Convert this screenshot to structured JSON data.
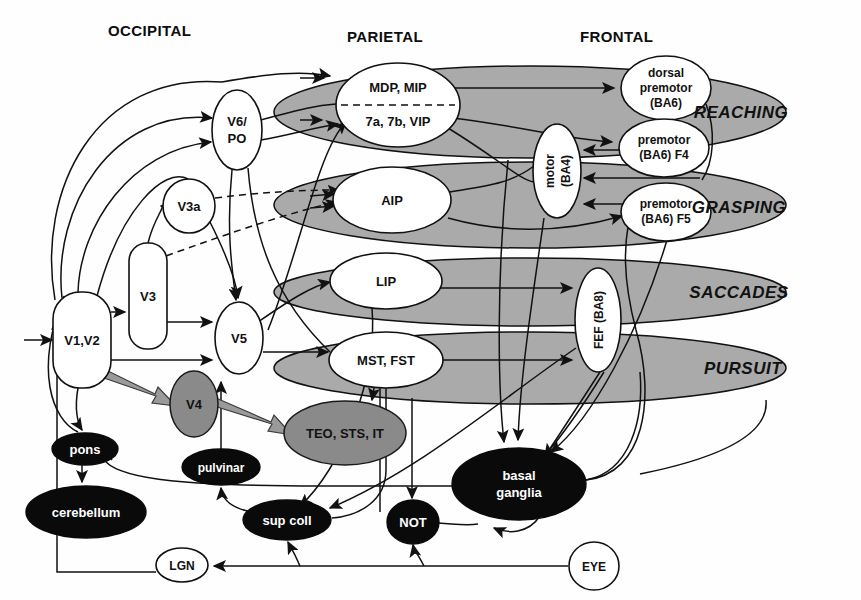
{
  "figure": {
    "lobe_headers": [
      {
        "id": "occipital",
        "label": "OCCIPITAL",
        "x": 108,
        "y": 36
      },
      {
        "id": "parietal",
        "label": "PARIETAL",
        "x": 347,
        "y": 42
      },
      {
        "id": "frontal",
        "label": "FRONTAL",
        "x": 580,
        "y": 42
      }
    ],
    "function_bands": [
      {
        "id": "reaching",
        "label": "REACHING",
        "lx": 741,
        "ly": 118,
        "cx": 530,
        "cy": 112,
        "rx": 256,
        "ry": 46
      },
      {
        "id": "grasping",
        "label": "GRASPING",
        "lx": 739,
        "ly": 213,
        "cx": 530,
        "cy": 205,
        "rx": 256,
        "ry": 43
      },
      {
        "id": "saccades",
        "label": "SACCADES",
        "lx": 739,
        "ly": 298,
        "cx": 530,
        "cy": 292,
        "rx": 256,
        "ry": 34
      },
      {
        "id": "pursuit",
        "label": "PURSUIT",
        "lx": 743,
        "ly": 374,
        "cx": 530,
        "cy": 368,
        "rx": 256,
        "ry": 36
      }
    ],
    "nodes": [
      {
        "id": "v1v2",
        "label": "V1,V2",
        "shape": "rounded",
        "fill": "white",
        "cx": 82,
        "cy": 340,
        "rx": 29,
        "ry": 48
      },
      {
        "id": "v3",
        "label": "V3",
        "shape": "rounded",
        "fill": "white",
        "cx": 148,
        "cy": 296,
        "rx": 19,
        "ry": 53
      },
      {
        "id": "v3a",
        "label": "V3a",
        "shape": "ellipse",
        "fill": "white",
        "cx": 189,
        "cy": 206,
        "rx": 26,
        "ry": 27
      },
      {
        "id": "v6po",
        "label": "V6/\nPO",
        "shape": "ellipse",
        "fill": "white",
        "cx": 237,
        "cy": 130,
        "rx": 25,
        "ry": 40
      },
      {
        "id": "v5",
        "label": "V5",
        "shape": "ellipse",
        "fill": "white",
        "cx": 239,
        "cy": 338,
        "rx": 24,
        "ry": 36
      },
      {
        "id": "v4",
        "label": "V4",
        "shape": "ellipse",
        "fill": "gray",
        "cx": 194,
        "cy": 404,
        "rx": 24,
        "ry": 33
      },
      {
        "id": "teostsit",
        "label": "TEO, STS, IT",
        "shape": "ellipse",
        "fill": "gray",
        "cx": 345,
        "cy": 433,
        "rx": 61,
        "ry": 32
      },
      {
        "id": "mdp_7a",
        "label": "MDP, MIP|7a, 7b, VIP",
        "shape": "ellipse-split",
        "fill": "white",
        "cx": 398,
        "cy": 105,
        "rx": 62,
        "ry": 42
      },
      {
        "id": "aip",
        "label": "AIP",
        "shape": "ellipse",
        "fill": "white",
        "cx": 392,
        "cy": 200,
        "rx": 59,
        "ry": 33
      },
      {
        "id": "lip",
        "label": "LIP",
        "shape": "ellipse",
        "fill": "white",
        "cx": 386,
        "cy": 281,
        "rx": 56,
        "ry": 28
      },
      {
        "id": "mstfst",
        "label": "MST, FST",
        "shape": "ellipse",
        "fill": "white",
        "cx": 386,
        "cy": 360,
        "rx": 57,
        "ry": 28
      },
      {
        "id": "motor_ba4",
        "label": "motor\n(BA4)",
        "shape": "ellipse",
        "fill": "white",
        "cx": 557,
        "cy": 171,
        "rx": 24,
        "ry": 47,
        "rotate": -90
      },
      {
        "id": "dorsal_premotor",
        "label": "dorsal\npremotor\n(BA6)",
        "shape": "ellipse",
        "fill": "white",
        "cx": 666,
        "cy": 88,
        "rx": 45,
        "ry": 32
      },
      {
        "id": "premotor_f4",
        "label": "premotor\n(BA6) F4",
        "shape": "ellipse",
        "fill": "white",
        "cx": 664,
        "cy": 148,
        "rx": 45,
        "ry": 29
      },
      {
        "id": "premotor_f5",
        "label": "premotor\n(BA6) F5",
        "shape": "ellipse",
        "fill": "white",
        "cx": 666,
        "cy": 212,
        "rx": 45,
        "ry": 29
      },
      {
        "id": "fef_ba8",
        "label": "FEF (BA8)",
        "shape": "ellipse",
        "fill": "white",
        "cx": 598,
        "cy": 320,
        "rx": 23,
        "ry": 52,
        "rotate": -90
      },
      {
        "id": "pons",
        "label": "pons",
        "shape": "ellipse",
        "fill": "black",
        "cx": 85,
        "cy": 449,
        "rx": 33,
        "ry": 16
      },
      {
        "id": "cerebellum",
        "label": "cerebellum",
        "shape": "ellipse",
        "fill": "black",
        "cx": 86,
        "cy": 512,
        "rx": 60,
        "ry": 26
      },
      {
        "id": "pulvinar",
        "label": "pulvinar",
        "shape": "ellipse",
        "fill": "black",
        "cx": 221,
        "cy": 467,
        "rx": 39,
        "ry": 18
      },
      {
        "id": "supcoll",
        "label": "sup coll",
        "shape": "ellipse",
        "fill": "black",
        "cx": 287,
        "cy": 520,
        "rx": 44,
        "ry": 20
      },
      {
        "id": "not",
        "label": "NOT",
        "shape": "ellipse",
        "fill": "black",
        "cx": 413,
        "cy": 522,
        "rx": 26,
        "ry": 22
      },
      {
        "id": "basal",
        "label": "basal\nganglia",
        "shape": "ellipse",
        "fill": "black",
        "cx": 519,
        "cy": 484,
        "rx": 67,
        "ry": 36
      },
      {
        "id": "lgn",
        "label": "LGN",
        "shape": "ellipse",
        "fill": "white",
        "cx": 182,
        "cy": 565,
        "rx": 26,
        "ry": 17
      },
      {
        "id": "eye",
        "label": "EYE",
        "shape": "ellipse",
        "fill": "white",
        "cx": 594,
        "cy": 566,
        "rx": 25,
        "ry": 24
      }
    ],
    "node_labels": {
      "v1v2": "V1,V2",
      "v3": "V3",
      "v3a": "V3a",
      "v6po_line1": "V6/",
      "v6po_line2": "PO",
      "v5": "V5",
      "v4": "V4",
      "teostsit": "TEO, STS, IT",
      "mdp": "MDP, MIP",
      "seven": "7a, 7b, VIP",
      "aip": "AIP",
      "lip": "LIP",
      "mstfst": "MST, FST",
      "motor_l1": "motor",
      "motor_l2": "(BA4)",
      "dp_l1": "dorsal",
      "dp_l2": "premotor",
      "dp_l3": "(BA6)",
      "f4_l1": "premotor",
      "f4_l2": "(BA6) F4",
      "f5_l1": "premotor",
      "f5_l2": "(BA6) F5",
      "fef": "FEF (BA8)",
      "pons": "pons",
      "cerebellum": "cerebellum",
      "pulvinar": "pulvinar",
      "supcoll": "sup coll",
      "not": "NOT",
      "basal_l1": "basal",
      "basal_l2": "ganglia",
      "lgn": "LGN",
      "eye": "EYE"
    },
    "colors": {
      "band_gray": "#aaaaaa",
      "node_gray": "#8a8a8a",
      "node_black": "#0a0a0a",
      "stroke": "#111111",
      "fat_arrow_gray": "#9a9a9a",
      "background": "#fefefe"
    },
    "edge_styles": {
      "solid": "solid thin arrow",
      "dashed": "dashed thin arrow",
      "fat_gray": "thick gray ventral-stream arrow"
    }
  }
}
